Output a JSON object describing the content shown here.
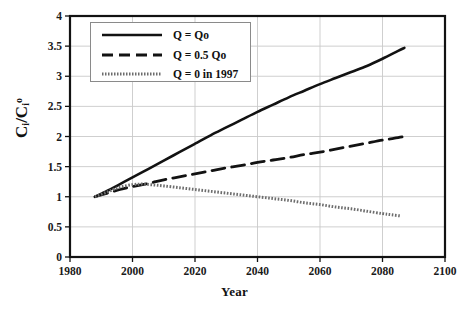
{
  "chart_data": {
    "type": "line",
    "title": "",
    "xlabel": "Year",
    "ylabel": "Ci/Ci°",
    "ylabel_parts": {
      "num": "C",
      "num_sub": "i",
      "den": "C",
      "den_sub": "i",
      "den_sup": "o"
    },
    "xlim": [
      1980,
      2100
    ],
    "ylim": [
      0,
      4
    ],
    "xticks": [
      "1980",
      "2000",
      "2020",
      "2040",
      "2060",
      "2080",
      "2100"
    ],
    "xtick_values": [
      1980,
      2000,
      2020,
      2040,
      2060,
      2080,
      2100
    ],
    "yticks": [
      "0",
      "0.5",
      "1",
      "1.5",
      "2",
      "2.5",
      "3",
      "3.5",
      "4"
    ],
    "ytick_values": [
      0,
      0.5,
      1,
      1.5,
      2,
      2.5,
      3,
      3.5,
      4
    ],
    "grid": true,
    "legend_position": "upper-left-inside",
    "series": [
      {
        "name": "Q = Qo",
        "style": "solid",
        "color": "#121212",
        "width": 2.6,
        "x": [
          1988,
          1992,
          1996,
          2000,
          2005,
          2010,
          2015,
          2020,
          2025,
          2030,
          2035,
          2040,
          2045,
          2050,
          2055,
          2060,
          2065,
          2070,
          2075,
          2080,
          2085,
          2087
        ],
        "y": [
          1.0,
          1.1,
          1.21,
          1.32,
          1.46,
          1.6,
          1.74,
          1.88,
          2.02,
          2.15,
          2.28,
          2.41,
          2.53,
          2.65,
          2.76,
          2.87,
          2.97,
          3.07,
          3.17,
          3.29,
          3.42,
          3.47
        ]
      },
      {
        "name": "Q = 0.5 Qo",
        "style": "dashed",
        "color": "#121212",
        "width": 2.8,
        "x": [
          1988,
          1992,
          1996,
          2000,
          2005,
          2010,
          2015,
          2020,
          2025,
          2030,
          2035,
          2040,
          2045,
          2050,
          2055,
          2060,
          2065,
          2070,
          2075,
          2080,
          2085,
          2087
        ],
        "y": [
          1.0,
          1.06,
          1.12,
          1.17,
          1.22,
          1.28,
          1.33,
          1.38,
          1.43,
          1.48,
          1.52,
          1.57,
          1.61,
          1.65,
          1.7,
          1.74,
          1.79,
          1.84,
          1.89,
          1.94,
          1.98,
          2.0
        ]
      },
      {
        "name": "Q = 0 in 1997",
        "style": "dotted",
        "color": "#6d6d6d",
        "width": 3.0,
        "x": [
          1988,
          1992,
          1996,
          2000,
          2003,
          2006,
          2010,
          2015,
          2020,
          2025,
          2030,
          2035,
          2040,
          2045,
          2050,
          2055,
          2060,
          2065,
          2070,
          2075,
          2080,
          2083,
          2086
        ],
        "y": [
          1.0,
          1.08,
          1.16,
          1.2,
          1.21,
          1.2,
          1.18,
          1.15,
          1.12,
          1.09,
          1.06,
          1.03,
          1.0,
          0.97,
          0.94,
          0.9,
          0.87,
          0.83,
          0.8,
          0.76,
          0.72,
          0.7,
          0.68
        ]
      }
    ]
  },
  "legend": {
    "items": [
      {
        "label": "Q = Qo",
        "style": "solid"
      },
      {
        "label": "Q = 0.5 Qo",
        "style": "dashed"
      },
      {
        "label": "Q = 0 in 1997",
        "style": "dotted"
      }
    ]
  },
  "colors": {
    "axis": "#121212",
    "grid": "#c9c9c9",
    "legend_border": "#8a8a8a",
    "series_solid": "#121212",
    "series_dashed": "#121212",
    "series_dotted": "#6d6d6d",
    "background": "#ffffff"
  }
}
